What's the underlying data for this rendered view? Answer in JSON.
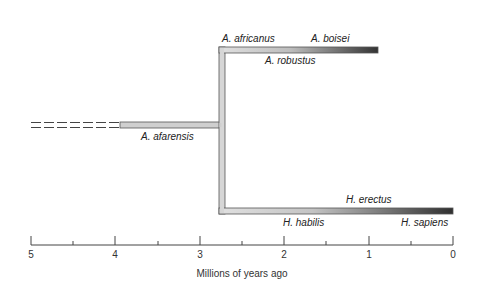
{
  "diagram": {
    "type": "phylogenetic-tree",
    "species": {
      "afarensis": "A. afarensis",
      "africanus": "A. africanus",
      "boisei": "A. boisei",
      "robustus": "A. robustus",
      "erectus": "H. erectus",
      "habilis": "H. habilis",
      "sapiens": "H. sapiens"
    },
    "axis": {
      "title": "Millions of years ago",
      "ticks": [
        "5",
        "4",
        "3",
        "2",
        "1",
        "0"
      ]
    },
    "colors": {
      "bar_light": "#d8d8d8",
      "bar_dark": "#333333",
      "outline": "#555555"
    }
  }
}
